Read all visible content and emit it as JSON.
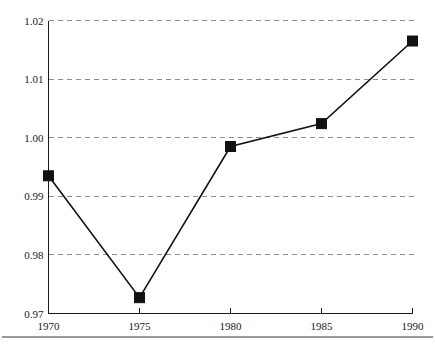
{
  "chart_data": {
    "type": "line",
    "title": "",
    "subtitle": "",
    "xlabel": "",
    "ylabel": "",
    "x": [
      1970,
      1975,
      1980,
      1985,
      1990
    ],
    "values": [
      0.9935,
      0.9727,
      0.9985,
      1.0024,
      1.0165
    ],
    "series": [
      {
        "name": "",
        "values": [
          0.9935,
          0.9727,
          0.9985,
          1.0024,
          1.0165
        ]
      }
    ],
    "xlim": [
      1970,
      1990
    ],
    "ylim": [
      0.97,
      1.02
    ],
    "x_ticks": [
      1970,
      1975,
      1980,
      1985,
      1990
    ],
    "x_tick_labels": [
      "1970",
      "1975",
      "1980",
      "1985",
      "1990"
    ],
    "y_ticks": [
      0.97,
      0.98,
      0.99,
      1.0,
      1.01,
      1.02
    ],
    "y_tick_labels": [
      "0.97",
      "0.98",
      "0.99",
      "1.00",
      "1.01",
      "1.02"
    ],
    "grid": "horizontal-dashed",
    "legend": "none",
    "marker": "filled-square",
    "line_color": "#111111",
    "marker_color": "#111111",
    "gridline_color": "#8c8c8c",
    "axis_color": "#1a1a1a",
    "footer_rule_color": "#9a9a9a",
    "annotations": []
  }
}
